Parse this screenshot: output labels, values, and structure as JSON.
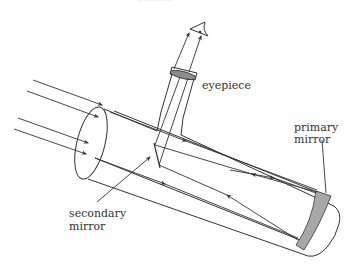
{
  "diagram": {
    "clipped_top_text": "············",
    "labels": {
      "eyepiece": "eyepiece",
      "primary_line1": "primary",
      "primary_line2": "mirror",
      "secondary_line1": "secondary",
      "secondary_line2": "mirror"
    },
    "colors": {
      "stroke": "#333333",
      "mirror_fill": "#a8a8a8",
      "lens_fill": "#8c8c8c",
      "background": "#ffffff"
    }
  }
}
